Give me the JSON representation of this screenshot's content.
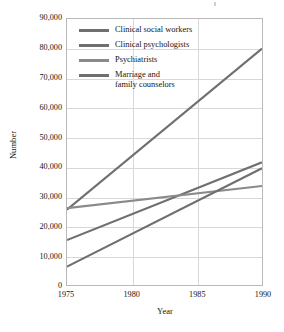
{
  "chart_data": {
    "type": "line",
    "title": "",
    "xlabel": "Year",
    "ylabel": "Number",
    "x": [
      1975,
      1990
    ],
    "xlim": [
      1975,
      1990
    ],
    "ylim": [
      0,
      90000
    ],
    "xticks": [
      "1975",
      "1980",
      "1985",
      "1990"
    ],
    "xtick_values": [
      1975,
      1980,
      1985,
      1990
    ],
    "yticks": [
      "0",
      "10,000",
      "20,000",
      "30,000",
      "40,000",
      "50,000",
      "60,000",
      "70,000",
      "80,000",
      "90,000"
    ],
    "ytick_values": [
      0,
      10000,
      20000,
      30000,
      40000,
      50000,
      60000,
      70000,
      80000,
      90000
    ],
    "grid": true,
    "legend_position": "upper-left-inside",
    "series": [
      {
        "name": "Clinical social workers",
        "color": "#6f6f6f",
        "x": [
          1975,
          1990
        ],
        "values": [
          25500,
          80000
        ]
      },
      {
        "name": "Clinical psychologists",
        "color": "#6f6f6f",
        "x": [
          1975,
          1990
        ],
        "values": [
          15200,
          41500
        ]
      },
      {
        "name": "Psychiatrists",
        "color": "#8a8a8a",
        "x": [
          1975,
          1990
        ],
        "values": [
          26000,
          33500
        ]
      },
      {
        "name": "Marriage and\nfamily counselors",
        "color": "#6f6f6f",
        "x": [
          1975,
          1990
        ],
        "values": [
          6200,
          39500
        ]
      }
    ]
  },
  "legend": {
    "items": [
      {
        "label": "Clinical social workers",
        "color": "#6f6f6f"
      },
      {
        "label": "Clinical psychologists",
        "color": "#6f6f6f"
      },
      {
        "label": "Psychiatrists",
        "color": "#8a8a8a"
      },
      {
        "label": "Marriage and\nfamily counselors",
        "color": "#6f6f6f"
      }
    ]
  },
  "axes": {
    "y_title": "Number",
    "x_title": "Year"
  },
  "colors": {
    "plot_border": "#b9b9b9",
    "gridline": "#d8d8d8",
    "background": "#ffffff",
    "text": "#17140f"
  }
}
